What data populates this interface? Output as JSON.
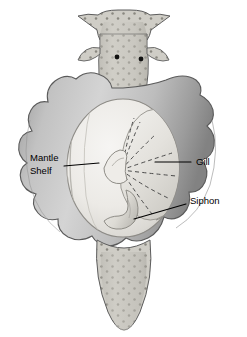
{
  "figure": {
    "background_color": "#ffffff",
    "outline_color": "#3f3f3f"
  },
  "palette": {
    "mantle_light": "#d9d9d9",
    "mantle_mid": "#b8b8b8",
    "mantle_dark": "#8e8e8e",
    "mantle_shadow": "#6f6f6f",
    "cavity_light": "#f0efed",
    "cavity_mid": "#e2e1dd",
    "cavity_shade": "#c9c8c4",
    "body_speckle_base": "#cfcdc6",
    "body_speckle_dot": "#8a8880",
    "eye_color": "#111111",
    "label_text": "#000000",
    "leader_line": "#000000",
    "dashed_line": "#4a4a4a"
  },
  "labels": [
    {
      "id": "mantle-shelf",
      "lines": [
        "Mantle",
        "Shelf"
      ],
      "line1": "Mantle",
      "line2": "Shelf",
      "text_x": 30,
      "text_y": 158,
      "leader": {
        "x1": 64,
        "y1": 166,
        "x2": 99,
        "y2": 163
      }
    },
    {
      "id": "gill",
      "lines": [
        "Gill"
      ],
      "line1": "Gill",
      "text_x": 194,
      "text_y": 162,
      "leader": {
        "x1": 191,
        "y1": 162,
        "x2": 155,
        "y2": 162
      }
    },
    {
      "id": "siphon",
      "lines": [
        "Siphon"
      ],
      "line1": "Siphon",
      "text_x": 189,
      "text_y": 201,
      "leader": {
        "x1": 186,
        "y1": 204,
        "x2": 134,
        "y2": 219
      }
    }
  ],
  "anatomy": {
    "head": {
      "name": "head",
      "eye_count": 2,
      "texture": "speckled"
    },
    "mantle": {
      "name": "mantle",
      "texture": "smooth-lobed"
    },
    "cavity": {
      "name": "mantle-cavity",
      "shape": "oval"
    },
    "gill": {
      "name": "gill",
      "style": "fan-with-dashed-radials",
      "radial_count": 7
    },
    "siphon": {
      "name": "siphon",
      "style": "curved-tube"
    },
    "foot": {
      "name": "foot",
      "texture": "speckled",
      "shape": "tapering-cone"
    }
  }
}
